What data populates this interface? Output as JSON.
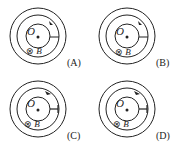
{
  "diagrams": [
    {
      "id": "A",
      "label": "(A)",
      "center_label": "O",
      "field_symbol": "⊗",
      "field_label": "B",
      "arrow_direction": "clockwise",
      "radial_style": "plain"
    },
    {
      "id": "B",
      "label": "(B)",
      "center_label": "O",
      "field_symbol": "⊗",
      "field_label": "B",
      "arrow_direction": "clockwise",
      "radial_style": "plain"
    },
    {
      "id": "C",
      "label": "(C)",
      "center_label": "O",
      "field_symbol": "⊗",
      "field_label": "B",
      "arrow_direction": "counterclockwise",
      "radial_style": "tee"
    },
    {
      "id": "D",
      "label": "(D)",
      "center_label": "O",
      "field_symbol": "⊗",
      "field_label": "B",
      "arrow_direction": "counterclockwise",
      "radial_style": "tee"
    }
  ],
  "colors": {
    "stroke": "#222222",
    "background": "#ffffff"
  }
}
